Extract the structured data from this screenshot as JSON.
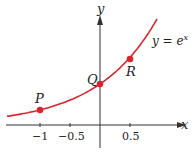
{
  "chart_data": {
    "type": "line",
    "title": "",
    "xlabel": "x",
    "ylabel": "y",
    "curve_label": "y = e^x",
    "function": "e^x",
    "xlim": [
      -1.6,
      1.0
    ],
    "x_ticks": [
      "-1",
      "-0.5",
      "0.5"
    ],
    "x_tick_values": [
      -1,
      -0.5,
      0.5
    ],
    "series": [
      {
        "name": "y = e^x",
        "x": [
          -1.5,
          -1,
          -0.5,
          0,
          0.5,
          0.9
        ],
        "values": [
          0.223,
          0.368,
          0.607,
          1.0,
          1.649,
          2.46
        ]
      }
    ],
    "points": [
      {
        "label": "P",
        "x": -1,
        "y": 0.368
      },
      {
        "label": "Q",
        "x": 0,
        "y": 1.0
      },
      {
        "label": "R",
        "x": 0.5,
        "y": 1.649
      }
    ],
    "grid": false,
    "curve_color": "#d8242b"
  },
  "labels": {
    "y_axis": "y",
    "x_axis": "x",
    "curve": "y = e",
    "curve_exp": "x",
    "P": "P",
    "Q": "Q",
    "R": "R",
    "tick_m1": "−1",
    "tick_m05": "−0.5",
    "tick_05": "0.5"
  }
}
